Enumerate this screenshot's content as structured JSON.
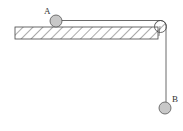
{
  "diagram": {
    "title": "",
    "labels": {
      "ball_a": "A",
      "ball_b": "B"
    },
    "colors": {
      "ball_fill": "#c8c8c8",
      "stroke": "#444444",
      "hatch": "#555555",
      "background": "#ffffff"
    },
    "elements": [
      {
        "id": "table-surface",
        "type": "hatched-rect"
      },
      {
        "id": "ball-a",
        "type": "circle",
        "label": "A"
      },
      {
        "id": "pulley",
        "type": "circle"
      },
      {
        "id": "string",
        "type": "polyline"
      },
      {
        "id": "ball-b",
        "type": "circle",
        "label": "B"
      }
    ]
  }
}
